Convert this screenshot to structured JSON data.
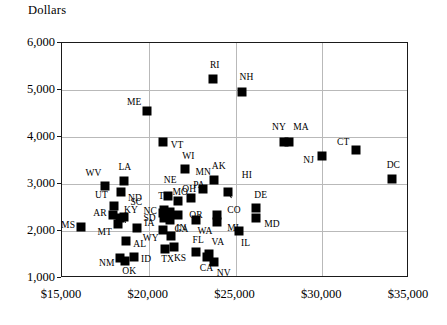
{
  "axis_title": "Dollars",
  "chart_data": {
    "type": "scatter",
    "title": "",
    "xlabel": "",
    "ylabel": "Dollars",
    "xlim": [
      15000,
      35000
    ],
    "ylim": [
      1000,
      6000
    ],
    "xticks": [
      "$15,000",
      "$20,000",
      "$25,000",
      "$30,000",
      "$35,000"
    ],
    "xtick_values": [
      15000,
      20000,
      25000,
      30000,
      35000
    ],
    "yticks": [
      "1,000",
      "2,000",
      "3,000",
      "4,000",
      "5,000",
      "6,000"
    ],
    "ytick_values": [
      1000,
      2000,
      3000,
      4000,
      5000,
      6000
    ],
    "grid": true,
    "legend": "none",
    "marker": "filled-square",
    "points": [
      {
        "label": "MS",
        "x": 16100,
        "y": 2080,
        "lx": -20,
        "ly": -2
      },
      {
        "label": "WV",
        "x": 17450,
        "y": 2950,
        "lx": -19,
        "ly": -13
      },
      {
        "label": "LA",
        "x": 18600,
        "y": 3070,
        "lx": -6,
        "ly": -14
      },
      {
        "label": "ND",
        "x": 18400,
        "y": 2840,
        "lx": 7,
        "ly": 6
      },
      {
        "label": "UT",
        "x": 18000,
        "y": 2530,
        "lx": -19,
        "ly": -11
      },
      {
        "label": "AR",
        "x": 17950,
        "y": 2330,
        "lx": -20,
        "ly": -2
      },
      {
        "label": "KY",
        "x": 18350,
        "y": 2280,
        "lx": 4,
        "ly": -8
      },
      {
        "label": "SC",
        "x": 18600,
        "y": 2300,
        "lx": 6,
        "ly": -15
      },
      {
        "label": "MT",
        "x": 18200,
        "y": 2140,
        "lx": -20,
        "ly": 8
      },
      {
        "label": "SD",
        "x": 19350,
        "y": 2060,
        "lx": 6,
        "ly": -10
      },
      {
        "label": "AL",
        "x": 18700,
        "y": 1780,
        "lx": 7,
        "ly": 3
      },
      {
        "label": "ID",
        "x": 19150,
        "y": 1440,
        "lx": 7,
        "ly": 2
      },
      {
        "label": "NM",
        "x": 18350,
        "y": 1430,
        "lx": -21,
        "ly": 5
      },
      {
        "label": "OK",
        "x": 18650,
        "y": 1370,
        "lx": -3,
        "ly": 10
      },
      {
        "label": "ME",
        "x": 19900,
        "y": 4550,
        "lx": -20,
        "ly": -9
      },
      {
        "label": "VT",
        "x": 20800,
        "y": 3890,
        "lx": 8,
        "ly": 3
      },
      {
        "label": "TN",
        "x": 20900,
        "y": 2450,
        "lx": -6,
        "ly": -14
      },
      {
        "label": "NC",
        "x": 20850,
        "y": 2380,
        "lx": -20,
        "ly": -2
      },
      {
        "label": "IA",
        "x": 20900,
        "y": 2280,
        "lx": -20,
        "ly": 5
      },
      {
        "label": "NE",
        "x": 21100,
        "y": 2750,
        "lx": -4,
        "ly": -16
      },
      {
        "label": "MO",
        "x": 21250,
        "y": 2400,
        "lx": 2,
        "ly": -20
      },
      {
        "label": "GA",
        "x": 21250,
        "y": 2230,
        "lx": 4,
        "ly": 9
      },
      {
        "label": "OH",
        "x": 21700,
        "y": 2630,
        "lx": 4,
        "ly": -12
      },
      {
        "label": "OR",
        "x": 21700,
        "y": 2330,
        "lx": 11,
        "ly": 0
      },
      {
        "label": "WI",
        "x": 22100,
        "y": 3320,
        "lx": -3,
        "ly": -13
      },
      {
        "label": "PA",
        "x": 22450,
        "y": 2700,
        "lx": 2,
        "ly": -13
      },
      {
        "label": "MN",
        "x": 23100,
        "y": 2900,
        "lx": -7,
        "ly": -17
      },
      {
        "label": "WA",
        "x": 22700,
        "y": 2230,
        "lx": 2,
        "ly": 11
      },
      {
        "label": "WY",
        "x": 20800,
        "y": 2030,
        "lx": -20,
        "ly": 8
      },
      {
        "label": "IN",
        "x": 21300,
        "y": 1890,
        "lx": 5,
        "ly": -8
      },
      {
        "label": "TX",
        "x": 20950,
        "y": 1620,
        "lx": -4,
        "ly": 10
      },
      {
        "label": "KS",
        "x": 21450,
        "y": 1660,
        "lx": 0,
        "ly": 11
      },
      {
        "label": "FL",
        "x": 22700,
        "y": 1560,
        "lx": -3,
        "ly": -12
      },
      {
        "label": "CA",
        "x": 23350,
        "y": 1450,
        "lx": -7,
        "ly": 11
      },
      {
        "label": "VA",
        "x": 23500,
        "y": 1520,
        "lx": 2,
        "ly": -12
      },
      {
        "label": "NV",
        "x": 23750,
        "y": 1330,
        "lx": 3,
        "ly": 11
      },
      {
        "label": "AK",
        "x": 23750,
        "y": 3080,
        "lx": -2,
        "ly": -14
      },
      {
        "label": "CO",
        "x": 23950,
        "y": 2330,
        "lx": 10,
        "ly": -5
      },
      {
        "label": "MI",
        "x": 23950,
        "y": 2200,
        "lx": 10,
        "ly": 6
      },
      {
        "label": "HI",
        "x": 24550,
        "y": 2840,
        "lx": 14,
        "ly": -17
      },
      {
        "label": "RI",
        "x": 23700,
        "y": 5240,
        "lx": -3,
        "ly": -14
      },
      {
        "label": "NH",
        "x": 25350,
        "y": 4960,
        "lx": -2,
        "ly": -15
      },
      {
        "label": "IL",
        "x": 25200,
        "y": 1990,
        "lx": 2,
        "ly": 12
      },
      {
        "label": "DE",
        "x": 26200,
        "y": 2490,
        "lx": -2,
        "ly": -13
      },
      {
        "label": "MD",
        "x": 26200,
        "y": 2270,
        "lx": 8,
        "ly": 6
      },
      {
        "label": "NY",
        "x": 27800,
        "y": 3890,
        "lx": -12,
        "ly": -15
      },
      {
        "label": "MA",
        "x": 28100,
        "y": 3890,
        "lx": 4,
        "ly": -15
      },
      {
        "label": "NJ",
        "x": 30000,
        "y": 3590,
        "lx": -19,
        "ly": 4
      },
      {
        "label": "CT",
        "x": 31950,
        "y": 3720,
        "lx": -19,
        "ly": -8
      },
      {
        "label": "DC",
        "x": 34000,
        "y": 3110,
        "lx": -5,
        "ly": -14
      }
    ],
    "leaders": [
      {
        "from_x": 18600,
        "from_y": 2300,
        "to_x": 18720,
        "to_y": 2180
      },
      {
        "from_x": 21250,
        "from_y": 2400,
        "to_x": 21130,
        "to_y": 2295
      },
      {
        "from_x": 24550,
        "from_y": 2840,
        "to_x": 24770,
        "to_y": 2720
      }
    ]
  }
}
